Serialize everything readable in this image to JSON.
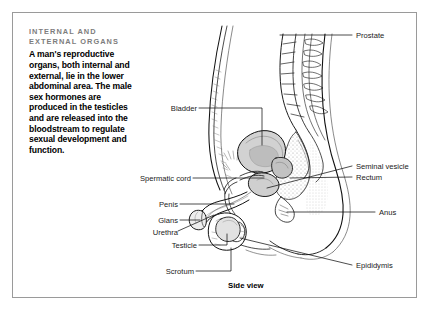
{
  "frame": {
    "present": true,
    "border_color": "#9a9a9a"
  },
  "textblock": {
    "heading": "Internal and external organs",
    "body": "A man's reproductive organs, both internal and external, lie in the lower abdominal area. The male sex hormones are produced in the testicles and are released into the bloodstream to regulate sexual development and function.",
    "heading_color": "#7d7d7d",
    "body_color": "#000000"
  },
  "caption": "Side view",
  "labels_left": [
    {
      "text": "Bladder"
    },
    {
      "text": "Spermatic cord"
    },
    {
      "text": "Penis"
    },
    {
      "text": "Glans"
    },
    {
      "text": "Urethra"
    },
    {
      "text": "Testicle"
    },
    {
      "text": "Scrotum"
    }
  ],
  "labels_right": [
    {
      "text": "Prostate"
    },
    {
      "text": "Seminal vesicle"
    },
    {
      "text": "Rectum"
    },
    {
      "text": "Anus"
    },
    {
      "text": "Epididymis"
    }
  ],
  "illustration": {
    "name": "male-reproductive-system-side-view",
    "line_color": "#111111",
    "shade_color": "#c9c9c9",
    "stipple_color": "#8d8d8d"
  }
}
